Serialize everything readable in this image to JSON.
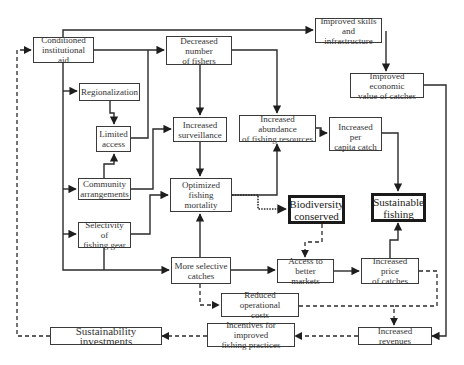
{
  "diagram": {
    "title": "",
    "nodes": {
      "conditioned_aid": "Conditioned\ninstitutional aid",
      "decreased_fishers": "Decreased number\nof fishers",
      "improved_skills": "Improved skills\nand infrastructure",
      "improved_economic": "Improved economic\nvalue of catches",
      "regionalization": "Regionalization",
      "limited_access": "Limited\naccess",
      "increased_surveillance": "Increased\nsurveillance",
      "increased_abundance": "Increased abundance\nof  fishing resources",
      "per_capita_catch": "Increased per\ncapita catch",
      "community_arrangements": "Community\narrangements",
      "optimized_mortality": "Optimized\nfishing\nmortality",
      "selectivity_gear": "Selectivity of\nfishing gear",
      "biodiversity": "Biodiversity\nconserved",
      "sustainable_fishing": "Sustainable\nfishing",
      "more_selective": "More selective\ncatches",
      "access_markets": "Access to\nbetter markets",
      "increased_price": "Increased price\nof catches",
      "reduced_costs": "Reduced operational\ncosts",
      "incentives": "Incentives for improved\nfishing  practices",
      "sustainability_investments": "Sustainability investments",
      "increased_revenues": "Increased revenues"
    },
    "edges": [
      {
        "from": "conditioned_aid",
        "to": "decreased_fishers",
        "style": "solid"
      },
      {
        "from": "conditioned_aid",
        "to": "improved_skills",
        "style": "solid"
      },
      {
        "from": "conditioned_aid",
        "to": "regionalization",
        "style": "solid"
      },
      {
        "from": "conditioned_aid",
        "to": "community_arrangements",
        "style": "solid"
      },
      {
        "from": "conditioned_aid",
        "to": "selectivity_gear",
        "style": "solid"
      },
      {
        "from": "conditioned_aid",
        "to": "more_selective",
        "style": "solid"
      },
      {
        "from": "regionalization",
        "to": "limited_access",
        "style": "solid"
      },
      {
        "from": "community_arrangements",
        "to": "limited_access",
        "style": "solid"
      },
      {
        "from": "limited_access",
        "to": "decreased_fishers",
        "style": "solid"
      },
      {
        "from": "community_arrangements",
        "to": "increased_surveillance",
        "style": "solid"
      },
      {
        "from": "selectivity_gear",
        "to": "optimized_mortality",
        "style": "solid"
      },
      {
        "from": "selectivity_gear",
        "to": "more_selective",
        "style": "solid"
      },
      {
        "from": "decreased_fishers",
        "to": "increased_surveillance",
        "style": "solid"
      },
      {
        "from": "decreased_fishers",
        "to": "increased_abundance",
        "style": "solid"
      },
      {
        "from": "increased_surveillance",
        "to": "optimized_mortality",
        "style": "solid"
      },
      {
        "from": "more_selective",
        "to": "optimized_mortality",
        "style": "solid"
      },
      {
        "from": "optimized_mortality",
        "to": "increased_abundance",
        "style": "solid"
      },
      {
        "from": "optimized_mortality",
        "to": "biodiversity",
        "style": "dotted"
      },
      {
        "from": "increased_abundance",
        "to": "per_capita_catch",
        "style": "solid"
      },
      {
        "from": "per_capita_catch",
        "to": "sustainable_fishing",
        "style": "solid"
      },
      {
        "from": "improved_skills",
        "to": "improved_economic",
        "style": "solid"
      },
      {
        "from": "improved_economic",
        "to": "increased_revenues",
        "style": "solid"
      },
      {
        "from": "more_selective",
        "to": "access_markets",
        "style": "solid"
      },
      {
        "from": "biodiversity",
        "to": "access_markets",
        "style": "dashed"
      },
      {
        "from": "access_markets",
        "to": "increased_price",
        "style": "solid"
      },
      {
        "from": "increased_price",
        "to": "sustainable_fishing",
        "style": "solid"
      },
      {
        "from": "more_selective",
        "to": "reduced_costs",
        "style": "dashed"
      },
      {
        "from": "increased_price",
        "to": "increased_revenues",
        "style": "dashed"
      },
      {
        "from": "reduced_costs",
        "to": "increased_revenues",
        "style": "dashed"
      },
      {
        "from": "increased_revenues",
        "to": "incentives",
        "style": "dashed"
      },
      {
        "from": "incentives",
        "to": "sustainability_investments",
        "style": "dashed"
      },
      {
        "from": "sustainability_investments",
        "to": "conditioned_aid",
        "style": "dashed"
      }
    ]
  },
  "colors": {
    "line": "#2a2a2a",
    "box_border": "#3a3a3a",
    "text": "#333333",
    "background": "#ffffff"
  }
}
